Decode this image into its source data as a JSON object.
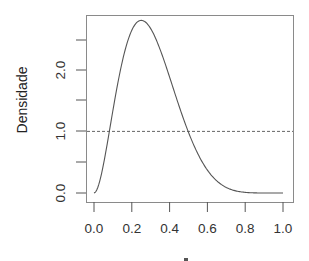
{
  "chart_data": {
    "type": "line",
    "title": "",
    "xlabel": "",
    "ylabel": "Densidade",
    "xlim": [
      0.0,
      1.0
    ],
    "ylim": [
      0.0,
      2.67
    ],
    "x_ticks": [
      0.0,
      0.2,
      0.4,
      0.6,
      0.8,
      1.0
    ],
    "x_tick_labels": [
      "0.0",
      "0.2",
      "0.4",
      "0.6",
      "0.8",
      "1.0"
    ],
    "y_ticks": [
      0.0,
      0.5,
      1.0,
      1.5,
      2.0,
      2.5
    ],
    "y_tick_labels": [
      "0.0",
      "",
      "1.0",
      "",
      "2.0",
      ""
    ],
    "grid": false,
    "legend": null,
    "series": [
      {
        "name": "densidade",
        "style": "solid",
        "x": [
          0.0,
          0.02,
          0.05,
          0.08,
          0.1,
          0.12,
          0.15,
          0.18,
          0.2,
          0.22,
          0.25,
          0.28,
          0.3,
          0.33,
          0.35,
          0.38,
          0.4,
          0.45,
          0.5,
          0.55,
          0.6,
          0.65,
          0.7,
          0.75,
          0.8,
          0.85,
          0.9,
          0.95,
          1.0
        ],
        "values": [
          0.0,
          0.15,
          0.79,
          1.55,
          1.94,
          2.28,
          2.62,
          2.82,
          2.82,
          2.79,
          2.67,
          2.48,
          2.33,
          2.07,
          1.89,
          1.61,
          1.42,
          1.03,
          0.7,
          0.45,
          0.27,
          0.15,
          0.08,
          0.035,
          0.014,
          0.004,
          0.0009,
          0.0001,
          0.0
        ]
      },
      {
        "name": "referencia-uniforme",
        "style": "dashed",
        "x": [
          0.0,
          1.0
        ],
        "values": [
          1.0,
          1.0
        ]
      }
    ],
    "annotations": []
  },
  "labels": {
    "ylabel": "Densidade",
    "x_ticks": [
      "0.0",
      "0.2",
      "0.4",
      "0.6",
      "0.8",
      "1.0"
    ],
    "y_ticks": [
      "0.0",
      "1.0",
      "2.0"
    ]
  }
}
